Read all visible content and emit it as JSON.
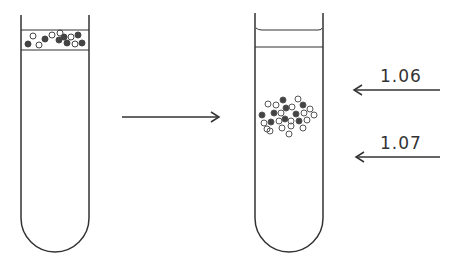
{
  "diagram": {
    "type": "density-gradient centrifugation illustration",
    "left_tube": {
      "description": "particles layered at top of gradient"
    },
    "transition_arrow": {
      "direction": "right"
    },
    "right_tube": {
      "description": "particles banded within gradient"
    },
    "density_markers": [
      {
        "label": "1.06",
        "y": 90
      },
      {
        "label": "1.07",
        "y": 157
      }
    ],
    "colors": {
      "stroke": "#333333",
      "dark_particle": "#444444",
      "background": "#ffffff"
    }
  }
}
